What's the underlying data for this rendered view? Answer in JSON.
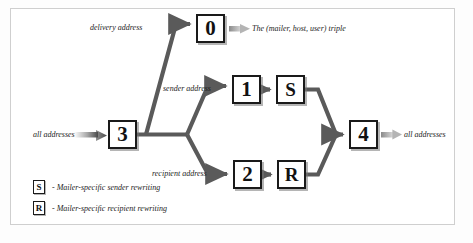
{
  "diagram": {
    "colors": {
      "line": "#5a5a5a",
      "node_border": "#1a1a1a",
      "text": "#1c1c1c",
      "frame": "#cfcfcf",
      "background": "#ffffff"
    },
    "nodes": [
      {
        "id": "n0",
        "label": "0",
        "x": 196,
        "y": 14,
        "kind": "ruleset"
      },
      {
        "id": "n1",
        "label": "1",
        "x": 232,
        "y": 75,
        "kind": "ruleset"
      },
      {
        "id": "nS",
        "label": "S",
        "x": 276,
        "y": 75,
        "kind": "mailer"
      },
      {
        "id": "n3",
        "label": "3",
        "x": 108,
        "y": 120,
        "kind": "ruleset"
      },
      {
        "id": "n4",
        "label": "4",
        "x": 349,
        "y": 120,
        "kind": "ruleset"
      },
      {
        "id": "n2",
        "label": "2",
        "x": 233,
        "y": 160,
        "kind": "ruleset"
      },
      {
        "id": "nR",
        "label": "R",
        "x": 277,
        "y": 160,
        "kind": "mailer"
      }
    ],
    "labels": [
      {
        "id": "delivery",
        "text": "delivery address",
        "x": 90,
        "y": 24
      },
      {
        "id": "triple",
        "text": "The (mailer, host, user) triple",
        "x": 252,
        "y": 27
      },
      {
        "id": "sender",
        "text": "sender address",
        "x": 163,
        "y": 85
      },
      {
        "id": "all_in",
        "text": "all addresses",
        "x": 33,
        "y": 131
      },
      {
        "id": "all_out",
        "text": "all addresses",
        "x": 397,
        "y": 131
      },
      {
        "id": "recipient",
        "text": "recipient address",
        "x": 152,
        "y": 170
      }
    ],
    "legend": [
      {
        "symbol": "S",
        "text": "- Mailer-specific sender rewriting",
        "x": 33,
        "y": 181
      },
      {
        "symbol": "R",
        "text": "- Mailer-specific recipient rewriting",
        "x": 33,
        "y": 202
      }
    ]
  }
}
